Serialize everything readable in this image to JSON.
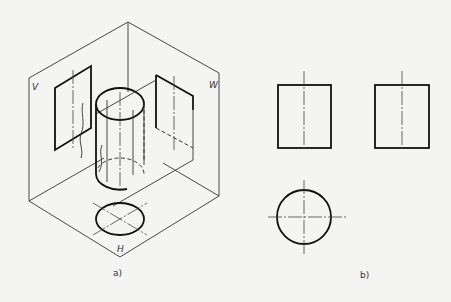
{
  "figure_a": {
    "caption": "a)",
    "plane_labels": {
      "v": "V",
      "w": "W",
      "h": "H"
    }
  },
  "figure_b": {
    "caption": "b)"
  },
  "colors": {
    "line": "#111111",
    "background": "#f4f4f2"
  }
}
